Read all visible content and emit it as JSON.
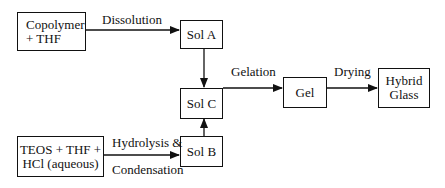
{
  "nodes": {
    "copolymer": {
      "label": "Copolymer\n+ THF"
    },
    "sol_a": {
      "label": "Sol A"
    },
    "sol_c": {
      "label": "Sol C"
    },
    "sol_b": {
      "label": "Sol B"
    },
    "teos": {
      "label": "TEOS + THF +\nHCl (aqueous)"
    },
    "gel": {
      "label": "Gel"
    },
    "hybrid_glass": {
      "label": "Hybrid\nGlass"
    }
  },
  "edges": {
    "dissolution": {
      "label": "Dissolution",
      "from": "copolymer",
      "to": "sol_a"
    },
    "hydrolysis": {
      "label_top": "Hydrolysis &",
      "label_bottom": "Condensation",
      "from": "teos",
      "to": "sol_b"
    },
    "sol_a_to_c": {
      "from": "sol_a",
      "to": "sol_c"
    },
    "sol_b_to_c": {
      "from": "sol_b",
      "to": "sol_c"
    },
    "gelation": {
      "label": "Gelation",
      "from": "sol_c",
      "to": "gel"
    },
    "drying": {
      "label": "Drying",
      "from": "gel",
      "to": "hybrid_glass"
    }
  }
}
